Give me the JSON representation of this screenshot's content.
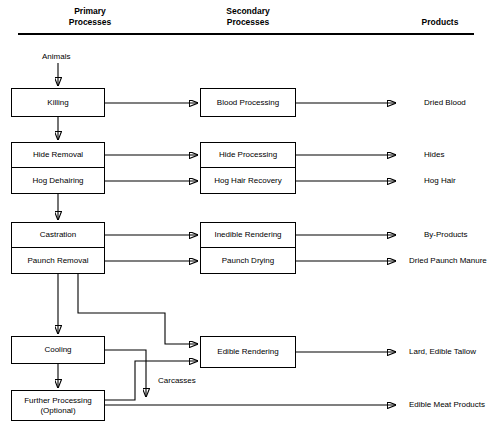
{
  "diagram": {
    "columns": [
      {
        "id": "primary",
        "label": "Primary\nProcesses"
      },
      {
        "id": "secondary",
        "label": "Secondary\nProcesses"
      },
      {
        "id": "products",
        "label": "Products"
      }
    ],
    "input_label": "Animals",
    "edge_label": "Carcasses",
    "primary_processes": [
      {
        "id": "killing",
        "label": "Killing"
      },
      {
        "id": "hide-removal",
        "label": "Hide Removal"
      },
      {
        "id": "hog-dehairing",
        "label": "Hog Dehairing"
      },
      {
        "id": "castration",
        "label": "Castration"
      },
      {
        "id": "paunch-removal",
        "label": "Paunch Removal"
      },
      {
        "id": "cooling",
        "label": "Cooling"
      },
      {
        "id": "further-processing",
        "label": "Further Processing\n(Optional)"
      }
    ],
    "secondary_processes": [
      {
        "id": "blood-processing",
        "label": "Blood Processing"
      },
      {
        "id": "hide-processing",
        "label": "Hide Processing"
      },
      {
        "id": "hog-hair-recovery",
        "label": "Hog Hair Recovery"
      },
      {
        "id": "inedible-rendering",
        "label": "Inedible Rendering"
      },
      {
        "id": "paunch-drying",
        "label": "Paunch Drying"
      },
      {
        "id": "edible-rendering",
        "label": "Edible Rendering"
      }
    ],
    "products": [
      {
        "id": "dried-blood",
        "label": "Dried Blood"
      },
      {
        "id": "hides",
        "label": "Hides"
      },
      {
        "id": "hog-hair",
        "label": "Hog Hair"
      },
      {
        "id": "by-products",
        "label": "By-Products"
      },
      {
        "id": "dried-paunch-manure",
        "label": "Dried Paunch Manure"
      },
      {
        "id": "lard-edible-tallow",
        "label": "Lard, Edible Tallow"
      },
      {
        "id": "edible-meat-products",
        "label": "Edible Meat Products"
      }
    ],
    "colors": {
      "line": "#000000",
      "box_fill": "#ffffff",
      "text": "#000000"
    }
  }
}
